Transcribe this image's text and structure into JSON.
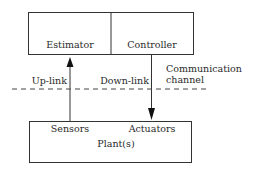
{
  "diagram": {
    "top_box": {
      "left_label": "Estimator",
      "right_label": "Controller"
    },
    "bottom_box": {
      "left_label": "Sensors",
      "right_label": "Actuators",
      "center_label": "Plant(s)"
    },
    "links": {
      "uplink_label": "Up-link",
      "downlink_label": "Down-link"
    },
    "channel": {
      "label_line1": "Communication",
      "label_line2": "channel"
    },
    "colors": {
      "stroke": "#333333",
      "background": "#ffffff"
    }
  }
}
